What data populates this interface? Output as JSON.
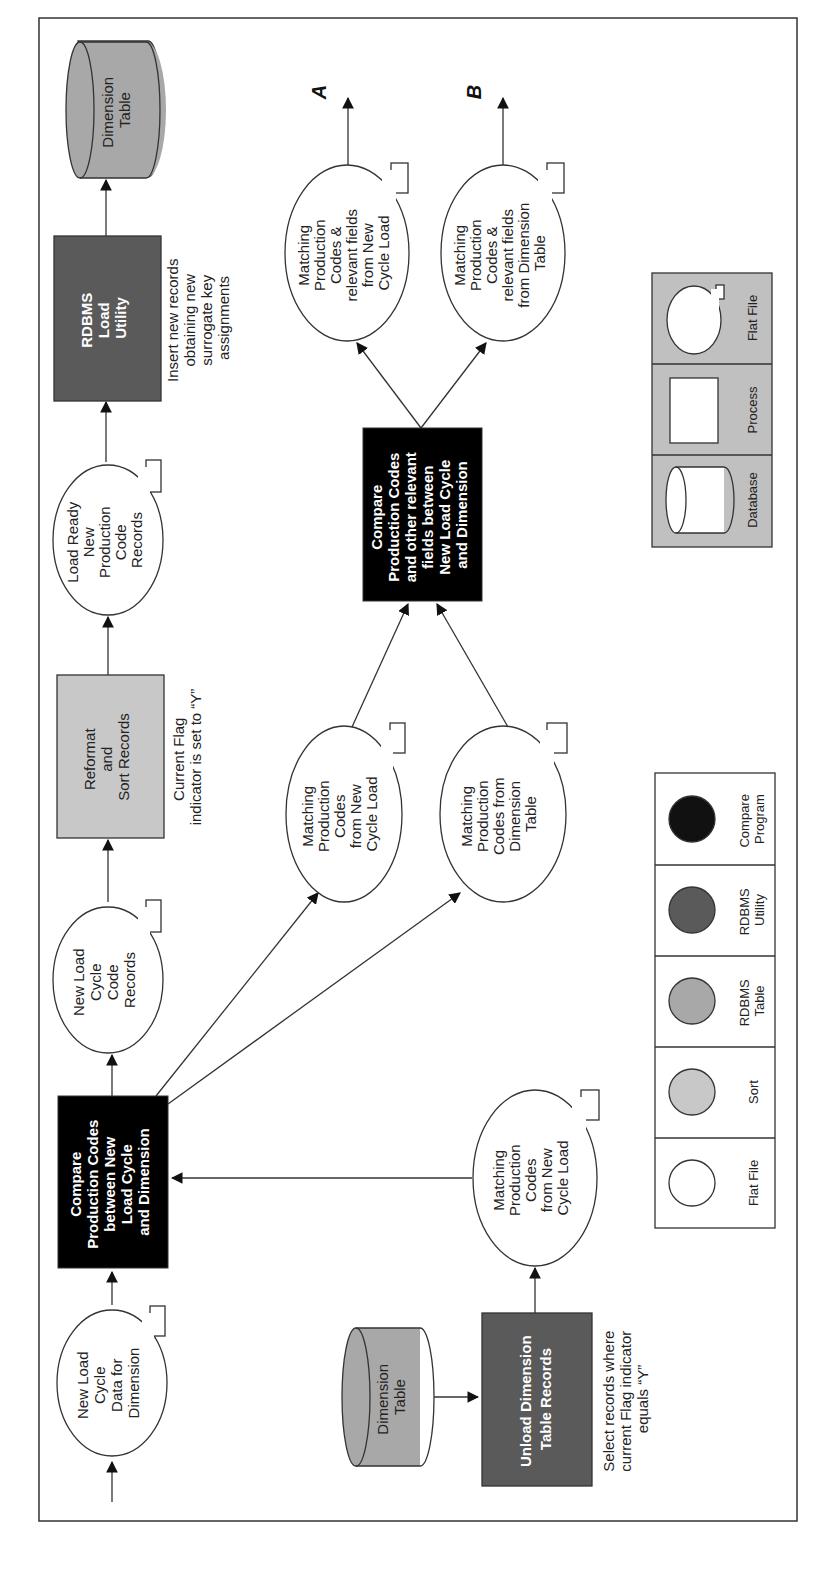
{
  "diagram": {
    "orientation": "rotated 90deg counter-clockwise (text reads bottom-to-top)",
    "colors": {
      "flat_file": "#ffffff",
      "sort": "#c8c8c8",
      "rdbms_table": "#a8a8a8",
      "rdbms_utility": "#5a5a5a",
      "compare_program": "#000000",
      "legend2_bg": "#c0c0c0",
      "line": "#333333"
    },
    "nodes": {
      "new_load_cycle_data": {
        "type": "flat-file",
        "lines": [
          "New Load",
          "Cycle",
          "Data for",
          "Dimension"
        ]
      },
      "compare1": {
        "type": "compare-program",
        "lines": [
          "Compare",
          "Production Codes",
          "between New",
          "Load Cycle",
          "and Dimension"
        ]
      },
      "new_load_cycle_code_records": {
        "type": "flat-file",
        "lines": [
          "New Load",
          "Cycle",
          "Code",
          "Records"
        ]
      },
      "reformat_sort": {
        "type": "sort",
        "lines": [
          "Reformat",
          "and",
          "Sort Records"
        ]
      },
      "reformat_note": {
        "lines": [
          "Current Flag",
          "indicator is set to “Y”"
        ]
      },
      "load_ready": {
        "type": "flat-file",
        "lines": [
          "Load Ready",
          "New",
          "Production",
          "Code",
          "Records"
        ]
      },
      "rdbms_load_utility": {
        "type": "rdbms-utility",
        "lines": [
          "RDBMS",
          "Load",
          "Utility"
        ]
      },
      "rdbms_load_note": {
        "lines": [
          "Insert new records",
          "obtaining new",
          "surrogate key",
          "assignments"
        ]
      },
      "dimension_table_top": {
        "type": "rdbms-table",
        "lines": [
          "Dimension",
          "Table"
        ]
      },
      "matching_new_cycle_mid": {
        "type": "flat-file",
        "lines": [
          "Matching",
          "Production",
          "Codes",
          "from New",
          "Cycle Load"
        ]
      },
      "matching_dimension_mid": {
        "type": "flat-file",
        "lines": [
          "Matching",
          "Production",
          "Codes from",
          "Dimension",
          "Table"
        ]
      },
      "compare2": {
        "type": "compare-program",
        "lines": [
          "Compare",
          "Production Codes",
          "and other relevant",
          "fields between",
          "New Load Cycle",
          "and Dimension"
        ]
      },
      "matching_relevant_new": {
        "type": "flat-file",
        "lines": [
          "Matching",
          "Production",
          "Codes &",
          "relevant fields",
          "from New",
          "Cycle Load"
        ]
      },
      "matching_relevant_dim": {
        "type": "flat-file",
        "lines": [
          "Matching",
          "Production",
          "Codes &",
          "relevant fields",
          "from Dimension",
          "Table"
        ]
      },
      "dimension_table_bottom": {
        "type": "rdbms-table",
        "lines": [
          "Dimension",
          "Table"
        ]
      },
      "unload_dimension": {
        "type": "rdbms-utility",
        "lines": [
          "Unload Dimension",
          "Table Records"
        ]
      },
      "unload_note": {
        "lines": [
          "Select records where",
          "current Flag indicator",
          "equals “Y”"
        ]
      },
      "matching_new_cycle_bottom": {
        "type": "flat-file",
        "lines": [
          "Matching",
          "Production",
          "Codes",
          "from New",
          "Cycle Load"
        ]
      }
    },
    "connectors": {
      "a": "A",
      "b": "B"
    },
    "legend_colors": {
      "items": [
        {
          "label_lines": [
            "Flat File"
          ],
          "color": "#ffffff"
        },
        {
          "label_lines": [
            "Sort"
          ],
          "color": "#c8c8c8"
        },
        {
          "label_lines": [
            "RDBMS",
            "Table"
          ],
          "color": "#a8a8a8"
        },
        {
          "label_lines": [
            "RDBMS",
            "Utility"
          ],
          "color": "#5a5a5a"
        },
        {
          "label_lines": [
            "Compare",
            "Program"
          ],
          "color": "#111111"
        }
      ]
    },
    "legend_shapes": {
      "items": [
        {
          "label": "Database"
        },
        {
          "label": "Process"
        },
        {
          "label": "Flat File"
        }
      ]
    }
  }
}
